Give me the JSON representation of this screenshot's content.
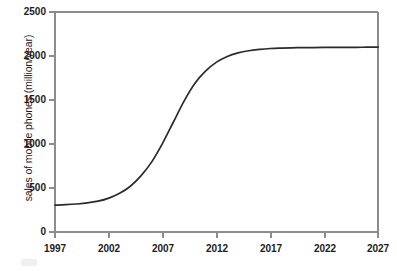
{
  "chart_data": {
    "type": "line",
    "title": "",
    "subtitle": "",
    "xlabel": "",
    "ylabel": "sales of mobile phones (million/year)",
    "xlim": [
      1997,
      2027
    ],
    "ylim": [
      0,
      2500
    ],
    "xticks": [
      "1997",
      "2002",
      "2007",
      "2012",
      "2017",
      "2022",
      "2027"
    ],
    "yticks": [
      "0",
      "500",
      "1000",
      "1500",
      "2000",
      "2500"
    ],
    "grid": false,
    "legend": false,
    "legend_position": "none",
    "line_color": "#2b2b2b",
    "axis_color": "#8c8c8c",
    "background_color": "#ffffff",
    "series": [
      {
        "name": "sales of mobile phones",
        "x": [
          1997,
          1998,
          1999,
          2000,
          2001,
          2002,
          2003,
          2004,
          2005,
          2006,
          2007,
          2008,
          2009,
          2010,
          2011,
          2012,
          2013,
          2014,
          2015,
          2016,
          2017,
          2018,
          2019,
          2020,
          2021,
          2022,
          2023,
          2024,
          2025,
          2026,
          2027
        ],
        "values": [
          305,
          310,
          318,
          330,
          350,
          385,
          440,
          520,
          640,
          800,
          1010,
          1250,
          1490,
          1690,
          1830,
          1930,
          1995,
          2035,
          2060,
          2075,
          2085,
          2090,
          2093,
          2095,
          2096,
          2097,
          2098,
          2099,
          2099,
          2100,
          2100
        ]
      }
    ],
    "annotations": []
  },
  "axis": {
    "y_label": "sales of mobile phones (million/year)",
    "y_ticks": [
      "2500",
      "2000",
      "1500",
      "1000",
      "500",
      "0"
    ],
    "x_ticks": [
      "1997",
      "2002",
      "2007",
      "2012",
      "2017",
      "2022",
      "2027"
    ]
  }
}
